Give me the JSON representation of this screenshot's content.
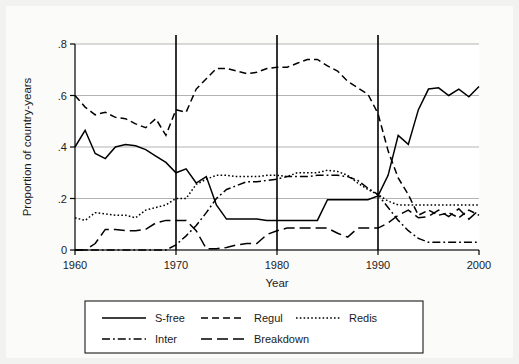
{
  "chart_data": {
    "type": "line",
    "title": "",
    "xlabel": "Year",
    "ylabel": "Proportion of country-years",
    "xlim": [
      1960,
      2000
    ],
    "ylim": [
      0,
      0.8
    ],
    "xticks": [
      1960,
      1970,
      1980,
      1990,
      2000
    ],
    "xtick_labels": [
      "1960",
      "1970",
      "1980",
      "1990",
      "2000"
    ],
    "yticks": [
      0,
      0.2,
      0.4,
      0.6,
      0.8
    ],
    "ytick_labels": [
      "0",
      ".2",
      ".4",
      ".6",
      ".8"
    ],
    "grid": "horizontal",
    "legend_position": "below",
    "vertical_reference_lines": [
      1970,
      1980,
      1990
    ],
    "x": [
      1960,
      1961,
      1962,
      1963,
      1964,
      1965,
      1966,
      1967,
      1968,
      1969,
      1970,
      1971,
      1972,
      1973,
      1974,
      1975,
      1976,
      1977,
      1978,
      1979,
      1980,
      1981,
      1982,
      1983,
      1984,
      1985,
      1986,
      1987,
      1988,
      1989,
      1990,
      1991,
      1992,
      1993,
      1994,
      1995,
      1996,
      1997,
      1998,
      1999,
      2000
    ],
    "series": [
      {
        "name": "S-free",
        "dash": "solid",
        "values": [
          0.4,
          0.465,
          0.375,
          0.355,
          0.4,
          0.41,
          0.405,
          0.39,
          0.365,
          0.34,
          0.3,
          0.315,
          0.26,
          0.285,
          0.175,
          0.12,
          0.12,
          0.12,
          0.12,
          0.115,
          0.115,
          0.115,
          0.115,
          0.115,
          0.115,
          0.195,
          0.195,
          0.195,
          0.195,
          0.195,
          0.21,
          0.29,
          0.445,
          0.41,
          0.545,
          0.625,
          0.63,
          0.6,
          0.625,
          0.595,
          0.635
        ]
      },
      {
        "name": "Regul",
        "dash": "dashed",
        "values": [
          0.6,
          0.555,
          0.525,
          0.535,
          0.515,
          0.51,
          0.49,
          0.475,
          0.51,
          0.445,
          0.545,
          0.535,
          0.625,
          0.665,
          0.705,
          0.705,
          0.695,
          0.685,
          0.69,
          0.705,
          0.71,
          0.71,
          0.725,
          0.74,
          0.74,
          0.715,
          0.695,
          0.655,
          0.63,
          0.605,
          0.53,
          0.385,
          0.28,
          0.215,
          0.135,
          0.155,
          0.135,
          0.145,
          0.125,
          0.155,
          0.135
        ]
      },
      {
        "name": "Redis",
        "dash": "dotted",
        "values": [
          0.125,
          0.115,
          0.145,
          0.14,
          0.135,
          0.135,
          0.125,
          0.155,
          0.165,
          0.175,
          0.2,
          0.2,
          0.255,
          0.275,
          0.29,
          0.29,
          0.285,
          0.285,
          0.285,
          0.29,
          0.29,
          0.285,
          0.3,
          0.3,
          0.3,
          0.31,
          0.305,
          0.29,
          0.26,
          0.235,
          0.215,
          0.19,
          0.175,
          0.175,
          0.175,
          0.175,
          0.175,
          0.175,
          0.175,
          0.175,
          0.175
        ]
      },
      {
        "name": "Inter",
        "dash": "dashdot",
        "values": [
          0.0,
          0.0,
          0.0,
          0.0,
          0.0,
          0.0,
          0.0,
          0.0,
          0.0,
          0.0,
          0.02,
          0.055,
          0.095,
          0.145,
          0.2,
          0.235,
          0.25,
          0.265,
          0.265,
          0.27,
          0.275,
          0.285,
          0.285,
          0.285,
          0.29,
          0.29,
          0.29,
          0.285,
          0.27,
          0.24,
          0.215,
          0.165,
          0.115,
          0.075,
          0.045,
          0.03,
          0.03,
          0.03,
          0.03,
          0.03,
          0.03
        ]
      },
      {
        "name": "Breakdown",
        "dash": "longdash",
        "values": [
          0.0,
          0.0,
          0.025,
          0.08,
          0.08,
          0.075,
          0.075,
          0.08,
          0.105,
          0.115,
          0.115,
          0.115,
          0.075,
          0.005,
          0.005,
          0.01,
          0.02,
          0.025,
          0.025,
          0.06,
          0.075,
          0.085,
          0.085,
          0.085,
          0.085,
          0.085,
          0.065,
          0.05,
          0.085,
          0.085,
          0.085,
          0.105,
          0.135,
          0.155,
          0.125,
          0.13,
          0.155,
          0.13,
          0.16,
          0.12,
          0.155
        ]
      }
    ],
    "legend": [
      {
        "label": "S-free",
        "dash": "solid"
      },
      {
        "label": "Regul",
        "dash": "dashed"
      },
      {
        "label": "Redis",
        "dash": "dotted"
      },
      {
        "label": "Inter",
        "dash": "dashdot"
      },
      {
        "label": "Breakdown",
        "dash": "longdash"
      }
    ],
    "colors": {
      "line": "#000000",
      "grid": "#b3b3b3",
      "axis": "#000000",
      "plot_background": "#ffffff",
      "figure_background": "#fbfbfa"
    }
  }
}
